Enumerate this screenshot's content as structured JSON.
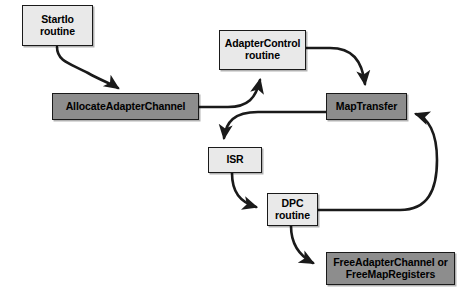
{
  "diagram": {
    "canvas": {
      "width": 467,
      "height": 295
    },
    "colors": {
      "light_fill": "#e9e9e9",
      "dark_fill": "#8d8d8d",
      "stroke": "#1a1a1a",
      "background": "#ffffff",
      "text": "#000000"
    },
    "nodes": [
      {
        "id": "startio",
        "label_line1": "StartIo",
        "label_line2": "routine",
        "style": "light",
        "x": 22,
        "y": 5,
        "w": 71,
        "h": 41,
        "font_size": 10.5
      },
      {
        "id": "allocate-adapter-channel",
        "label_line1": "AllocateAdapterChannel",
        "label_line2": "",
        "style": "dark",
        "x": 52,
        "y": 93,
        "w": 147,
        "h": 27,
        "font_size": 10.5
      },
      {
        "id": "adapter-control",
        "label_line1": "AdapterControl",
        "label_line2": "routine",
        "style": "light",
        "x": 219,
        "y": 30,
        "w": 87,
        "h": 40,
        "font_size": 10.5
      },
      {
        "id": "map-transfer",
        "label_line1": "MapTransfer",
        "label_line2": "",
        "style": "dark",
        "x": 326,
        "y": 93,
        "w": 81,
        "h": 27,
        "font_size": 10.5
      },
      {
        "id": "isr",
        "label_line1": "ISR",
        "label_line2": "",
        "style": "light",
        "x": 208,
        "y": 147,
        "w": 54,
        "h": 26,
        "font_size": 10.5
      },
      {
        "id": "dpc-routine",
        "label_line1": "DPC",
        "label_line2": "routine",
        "style": "light",
        "x": 267,
        "y": 193,
        "w": 51,
        "h": 33,
        "font_size": 10.5
      },
      {
        "id": "free-adapter-channel",
        "label_line1": "FreeAdapterChannel or",
        "label_line2": "FreeMapRegisters",
        "style": "dark",
        "x": 326,
        "y": 252,
        "w": 129,
        "h": 33,
        "font_size": 10.5
      }
    ],
    "edges": [
      {
        "id": "startio-to-allocate",
        "from": "startio",
        "to": "allocate-adapter-channel",
        "path": "M 57 47 C 57 62, 72 64, 88 73 C 100 80, 112 84, 118 88"
      },
      {
        "id": "allocate-to-adapter-control",
        "from": "allocate-adapter-channel",
        "to": "adapter-control",
        "path": "M 199 107 L 228 107 C 248 107, 256 98, 260 80"
      },
      {
        "id": "adapter-control-to-map-transfer",
        "from": "adapter-control",
        "to": "map-transfer",
        "path": "M 306 48 L 330 48 C 352 48, 362 60, 365 84"
      },
      {
        "id": "map-transfer-to-isr",
        "from": "map-transfer",
        "to": "isr",
        "path": "M 326 112 L 258 112 C 234 112, 226 122, 224 138"
      },
      {
        "id": "isr-to-dpc",
        "from": "isr",
        "to": "dpc-routine",
        "path": "M 232 173 C 232 192, 240 202, 256 207"
      },
      {
        "id": "dpc-to-map-transfer",
        "from": "dpc-routine",
        "to": "map-transfer",
        "path": "M 318 210 L 400 210 C 428 210, 437 190, 437 160 C 437 132, 428 118, 416 114"
      },
      {
        "id": "dpc-to-free",
        "from": "dpc-routine",
        "to": "free-adapter-channel",
        "path": "M 291 226 C 291 244, 300 256, 313 263"
      }
    ]
  }
}
